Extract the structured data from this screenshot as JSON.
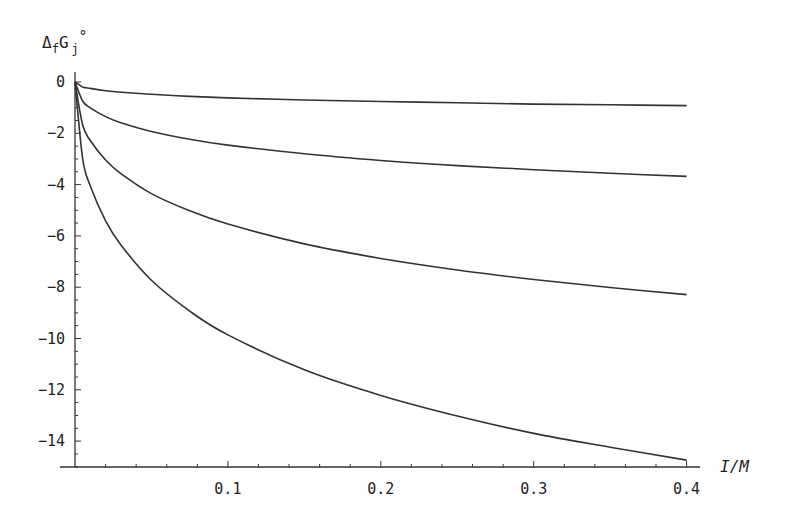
{
  "chart_data": {
    "type": "line",
    "title": "",
    "ylabel": "ΔfGj°",
    "ylabel_parts": {
      "main": "Δ",
      "sub1": "f",
      "mid": "G",
      "sub2": "j",
      "sup": "°"
    },
    "xlabel": "I/M",
    "xlim": [
      0,
      0.4
    ],
    "ylim": [
      -15,
      0
    ],
    "x_ticks": [
      0.1,
      0.2,
      0.3,
      0.4
    ],
    "x_tick_labels": [
      "0.1",
      "0.2",
      "0.3",
      "0.4"
    ],
    "y_ticks": [
      0,
      -2,
      -4,
      -6,
      -8,
      -10,
      -12,
      -14
    ],
    "y_tick_labels": [
      "0",
      "-2",
      "-4",
      "-6",
      "-8",
      "-10",
      "-12",
      "-14"
    ],
    "grid": false,
    "legend": null,
    "x": [
      0,
      0.005,
      0.01,
      0.02,
      0.03,
      0.05,
      0.075,
      0.1,
      0.15,
      0.2,
      0.25,
      0.3,
      0.35,
      0.4
    ],
    "series": [
      {
        "name": "curve-1",
        "values": [
          0,
          -0.19,
          -0.25,
          -0.34,
          -0.4,
          -0.48,
          -0.56,
          -0.62,
          -0.7,
          -0.76,
          -0.81,
          -0.86,
          -0.89,
          -0.92
        ]
      },
      {
        "name": "curve-2",
        "values": [
          0,
          -0.74,
          -1.01,
          -1.35,
          -1.59,
          -1.93,
          -2.23,
          -2.46,
          -2.8,
          -3.06,
          -3.26,
          -3.42,
          -3.56,
          -3.68
        ]
      },
      {
        "name": "curve-3",
        "values": [
          0,
          -1.67,
          -2.28,
          -3.04,
          -3.57,
          -4.35,
          -5.02,
          -5.54,
          -6.31,
          -6.88,
          -7.33,
          -7.7,
          -8.01,
          -8.29
        ]
      },
      {
        "name": "curve-4",
        "values": [
          0,
          -2.98,
          -4.05,
          -5.41,
          -6.35,
          -7.73,
          -8.93,
          -9.86,
          -11.22,
          -12.22,
          -13.02,
          -13.7,
          -14.24,
          -14.74
        ]
      }
    ]
  },
  "layout": {
    "x0_px": 75,
    "px_per_x": 1529,
    "y0_px": 82,
    "px_per_y": 25.65,
    "x_axis_y_px": 467,
    "x_axis_end_px": 700,
    "y_axis_top_px": 72
  }
}
